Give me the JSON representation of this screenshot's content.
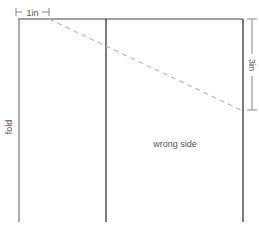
{
  "diagram": {
    "labels": {
      "top_dimension": "1in",
      "right_dimension": "3in",
      "left_edge": "fold",
      "panel": "wrong side"
    },
    "colors": {
      "outline": "#333333",
      "fold_line": "#777777",
      "dashed_line": "#bbbbbb",
      "dimension": "#888888",
      "text": "#555555"
    }
  }
}
